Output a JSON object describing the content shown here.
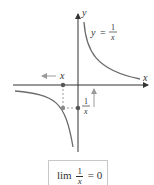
{
  "diagram": {
    "curve_label_lhs": "y",
    "curve_label_eq": "=",
    "curve_label_num": "1",
    "curve_label_den": "x",
    "axis_x_label": "x",
    "axis_y_label": "y",
    "moving_x_label": "x",
    "reciprocal_num": "1",
    "reciprocal_den": "x",
    "colors": {
      "axis": "#333333",
      "curve": "#6b6b6b",
      "arrow": "#9a9a9a",
      "point": "#555555"
    }
  },
  "limit": {
    "text": "lim",
    "num": "1",
    "den": "x",
    "equals": "= 0"
  }
}
